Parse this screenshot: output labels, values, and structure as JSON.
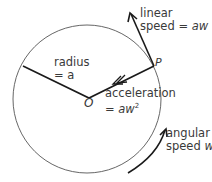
{
  "diagram": {
    "circle": {
      "cx": 87,
      "cy": 99,
      "r": 74
    },
    "points": {
      "center_label": "O",
      "point_label": "P"
    },
    "labels": {
      "linear_1": "linear",
      "linear_2": "speed = ",
      "linear_var": "aw",
      "radius_1": "radius",
      "radius_2": "= a",
      "accel_1": "acceleration",
      "accel_2": "= ",
      "accel_var": "aw",
      "accel_sup": "2",
      "angular_1": "angular",
      "angular_2": "speed ",
      "angular_var": "w"
    },
    "colors": {
      "line": "#1a1a1a",
      "circle": "#555555",
      "text": "#3a3a3a"
    }
  }
}
